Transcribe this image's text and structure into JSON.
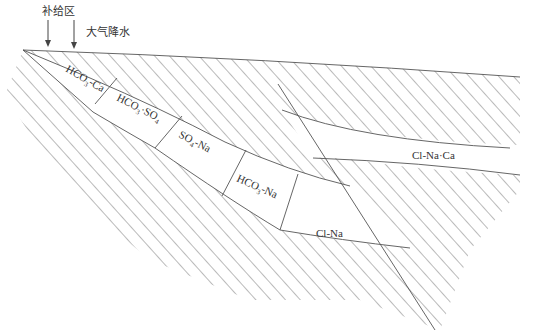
{
  "diagram": {
    "type": "hydrogeochemical-zonation-cross-section",
    "labels": {
      "recharge_zone": "补给区",
      "precipitation": "大气降水"
    },
    "zones": [
      {
        "id": "zone-1",
        "formula": "HCO",
        "sub1": "3",
        "rest": "-Ca"
      },
      {
        "id": "zone-2",
        "formula": "HCO",
        "sub1": "3",
        "mid": "·SO",
        "sub2": "4"
      },
      {
        "id": "zone-3",
        "formula": "SO",
        "sub1": "4",
        "rest": "-Na"
      },
      {
        "id": "zone-4",
        "formula": "HCO",
        "sub1": "3",
        "rest": "-Na"
      },
      {
        "id": "zone-5",
        "formula": "Cl-Na"
      },
      {
        "id": "zone-6",
        "formula": "Cl-Na·Ca"
      }
    ],
    "colors": {
      "line": "#555555",
      "hatch": "#666666",
      "text": "#333333",
      "background": "#ffffff"
    }
  }
}
